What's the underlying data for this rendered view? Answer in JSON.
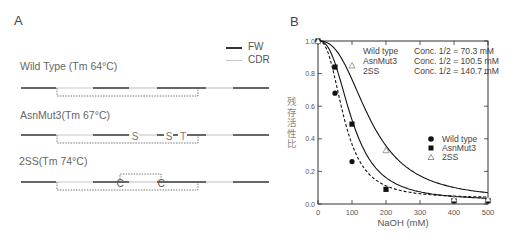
{
  "panel_a": {
    "label": "A",
    "legend": [
      {
        "label": "FW",
        "color": "#333333"
      },
      {
        "label": "CDR",
        "color": "#c8c8c8"
      }
    ],
    "constructs": [
      {
        "name": "Wild Type (Tm 64°C)",
        "mutations": []
      },
      {
        "name": "AsnMut3(Tm 67°C)",
        "mutations": [
          "S",
          "S",
          "T"
        ]
      },
      {
        "name": "2SS(Tm 74°C)",
        "mutations": [
          "C",
          "C"
        ]
      }
    ]
  },
  "panel_b": {
    "label": "B",
    "y_label": "残存活性比",
    "x_label": "NaOH (mM)",
    "annotations": [
      {
        "name": "Wild type",
        "value": "Conc. 1/2 = 70.3 mM"
      },
      {
        "name": "AsnMut3",
        "value": "Conc. 1/2 = 100.5 mM"
      },
      {
        "name": "2SS",
        "value": "Conc. 1/2 = 140.7 mM"
      }
    ],
    "legend": [
      {
        "marker": "●",
        "label": "Wild type"
      },
      {
        "marker": "■",
        "label": "AsnMut3"
      },
      {
        "marker": "△",
        "label": "2SS"
      }
    ],
    "x_ticks": [
      "0",
      "100",
      "200",
      "300",
      "400",
      "500"
    ],
    "y_ticks": [
      "0.0",
      "0.2",
      "0.4",
      "0.6",
      "0.8",
      "1.0"
    ]
  },
  "chart_data": {
    "type": "scatter",
    "title": "",
    "xlabel": "NaOH (mM)",
    "ylabel": "残存活性比",
    "xlim": [
      0,
      500
    ],
    "ylim": [
      0,
      1.0
    ],
    "grid": false,
    "legend_position": "lower right",
    "series": [
      {
        "name": "Wild type",
        "marker": "circle",
        "line": "dashed",
        "half_conc_mM": 70.3,
        "x": [
          0,
          50,
          100,
          400,
          500
        ],
        "y": [
          1.0,
          0.68,
          0.26,
          0.02,
          0.02
        ]
      },
      {
        "name": "AsnMut3",
        "marker": "square",
        "line": "solid",
        "half_conc_mM": 100.5,
        "x": [
          0,
          50,
          100,
          200,
          400,
          500
        ],
        "y": [
          1.0,
          0.84,
          0.49,
          0.09,
          0.02,
          0.02
        ]
      },
      {
        "name": "2SS",
        "marker": "triangle",
        "line": "solid",
        "half_conc_mM": 140.7,
        "x": [
          0,
          100,
          200,
          400,
          500
        ],
        "y": [
          1.0,
          0.85,
          0.33,
          0.03,
          0.03
        ]
      }
    ]
  }
}
